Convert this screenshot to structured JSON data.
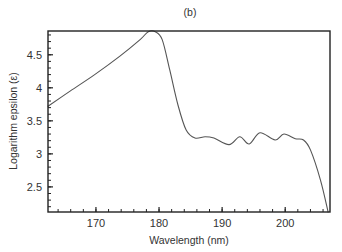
{
  "chart_data": {
    "type": "line",
    "title": "(b)",
    "xlabel": "Wavelength  (nm)",
    "ylabel": "Logarithm epsilon (ε)",
    "xlim": [
      162.4,
      207.1
    ],
    "ylim": [
      2.12,
      4.86
    ],
    "xticks": [
      170,
      180,
      190,
      200
    ],
    "xtick_labels": [
      "170",
      "180",
      "190",
      "200"
    ],
    "yticks": [
      2.5,
      3,
      3.5,
      4,
      4.5
    ],
    "ytick_labels": [
      "2.5",
      "3",
      "3.5",
      "4",
      "4.5"
    ],
    "x_minor_step": 2,
    "y_minor_step": 0.1,
    "grid": false,
    "legend": null,
    "series": [
      {
        "name": "log ε",
        "color": "#555555",
        "x": [
          162.4,
          165.9,
          169.8,
          173.8,
          177.0,
          178.3,
          179.4,
          180.5,
          181.7,
          183.0,
          184.3,
          185.7,
          187.3,
          188.7,
          191.1,
          192.8,
          194.3,
          196.0,
          198.4,
          199.8,
          201.6,
          202.9,
          204.0,
          205.6,
          206.8
        ],
        "y": [
          3.72,
          3.95,
          4.2,
          4.48,
          4.73,
          4.85,
          4.85,
          4.73,
          4.27,
          3.74,
          3.36,
          3.24,
          3.26,
          3.24,
          3.14,
          3.26,
          3.15,
          3.32,
          3.21,
          3.3,
          3.23,
          3.21,
          3.06,
          2.6,
          2.12
        ]
      }
    ]
  },
  "colors": {
    "axis": "#222222",
    "line": "#555555",
    "text": "#333333",
    "background": "#ffffff"
  }
}
